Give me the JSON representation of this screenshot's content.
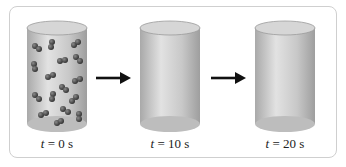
{
  "diagram": {
    "panels": [
      {
        "time_var": "t",
        "label": "= 0 s",
        "full_text": "t = 0 s",
        "has_molecules": true
      },
      {
        "time_var": "t",
        "label": "= 10 s",
        "full_text": "t = 10 s",
        "has_molecules": false
      },
      {
        "time_var": "t",
        "label": "= 20 s",
        "full_text": "t = 20 s",
        "has_molecules": false
      }
    ],
    "arrows": 2,
    "colors": {
      "cylinder_body": "#c4c4c4",
      "cylinder_top": "#d9d9d9",
      "molecule": "#4a4a4a",
      "arrow": "#111111",
      "frame_border": "#cfcfcf"
    }
  }
}
